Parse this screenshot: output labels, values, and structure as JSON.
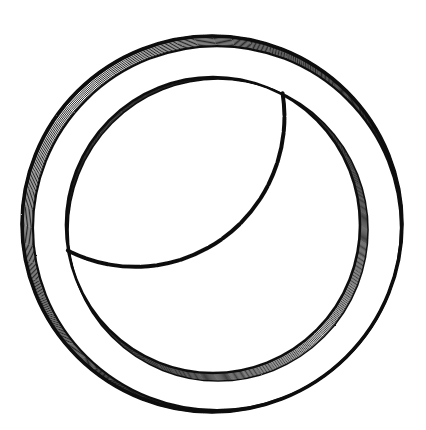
{
  "image": {
    "subject": "ring",
    "style": "black-and-white engraving / line-art illustration",
    "background": "#ffffff",
    "ink": "#111111"
  },
  "ring": {
    "center": [
      212,
      224
    ],
    "outer": {
      "rx": 190,
      "ry": 188,
      "heavy_side": "top-left",
      "hatch_lines": 9
    },
    "inner": {
      "rx": 147,
      "ry": 148,
      "heavy_side": "bottom-right",
      "hatch_lines": 8
    }
  }
}
